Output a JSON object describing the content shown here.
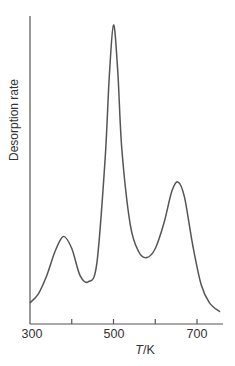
{
  "chart_data": {
    "type": "line",
    "title": "",
    "xlabel": "T/K",
    "xlabel_parts": {
      "symbol": "T",
      "unit": "/K"
    },
    "ylabel": "Desorption rate",
    "xlim": [
      300,
      760
    ],
    "xticks": [
      300,
      400,
      500,
      600,
      700
    ],
    "xtick_labels": [
      "300",
      "",
      "500",
      "",
      "700"
    ],
    "yticks": [],
    "grid": false,
    "legend": null,
    "series": [
      {
        "name": "Desorption rate",
        "color": "#555555",
        "x": [
          300,
          320,
          340,
          360,
          380,
          400,
          420,
          440,
          460,
          480,
          490,
          500,
          510,
          520,
          540,
          560,
          580,
          600,
          620,
          640,
          655,
          670,
          690,
          710,
          730,
          755
        ],
        "y": [
          0.07,
          0.1,
          0.16,
          0.24,
          0.29,
          0.25,
          0.16,
          0.14,
          0.2,
          0.55,
          0.82,
          0.99,
          0.84,
          0.58,
          0.33,
          0.24,
          0.22,
          0.25,
          0.33,
          0.44,
          0.47,
          0.42,
          0.26,
          0.13,
          0.07,
          0.04
        ]
      }
    ],
    "peaks": [
      {
        "T": 380,
        "relative_height": 0.29
      },
      {
        "T": 500,
        "relative_height": 0.99
      },
      {
        "T": 655,
        "relative_height": 0.47
      }
    ]
  },
  "labels": {
    "tick_300": "300",
    "tick_500": "500",
    "tick_700": "700",
    "xlabel_symbol": "T",
    "xlabel_unit": "/K",
    "ylabel": "Desorption rate"
  },
  "colors": {
    "axis": "#555555",
    "curve": "#555555",
    "background": "#ffffff"
  }
}
